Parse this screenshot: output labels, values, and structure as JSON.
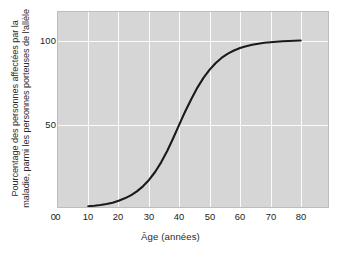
{
  "chart_data": {
    "type": "line",
    "title": "",
    "xlabel": "Âge (années)",
    "ylabel_lines": [
      "Pourcentage des personnes affectées par la",
      "maladie, parmi les personnes porteuses de l'allèle"
    ],
    "ylabel": "Pourcentage des personnes affectées par la maladie, parmi les personnes porteuses de l'allèle",
    "xlim": [
      0,
      89
    ],
    "ylim": [
      0,
      117
    ],
    "xticks": [
      0,
      10,
      20,
      30,
      40,
      50,
      60,
      70,
      80
    ],
    "xticklabels": [
      "0",
      "10",
      "20",
      "30",
      "40",
      "50",
      "60",
      "70",
      "80"
    ],
    "yticks": [
      0,
      50,
      100
    ],
    "yticklabels": [
      "0",
      "50",
      "100"
    ],
    "grid": true,
    "grid_color": "#fbfbfb",
    "plot_bgcolor": "#d6d6d6",
    "legend": "none",
    "series": [
      {
        "name": "Pénétrance liée à l'âge",
        "color": "#1a1a1a",
        "linewidth": 2.1,
        "x": [
          10,
          12,
          14,
          16,
          18,
          20,
          22,
          24,
          26,
          28,
          30,
          32,
          34,
          36,
          38,
          40,
          41,
          42,
          44,
          46,
          48,
          50,
          52,
          54,
          56,
          58,
          60,
          62,
          64,
          66,
          68,
          70,
          72,
          74,
          76,
          78,
          80
        ],
        "values": [
          0.5,
          0.8,
          1.2,
          1.8,
          2.6,
          3.8,
          5.2,
          7.0,
          9.4,
          12.4,
          16.2,
          21.0,
          26.8,
          33.6,
          41.4,
          49.6,
          53.6,
          57.6,
          65.0,
          71.8,
          77.6,
          82.4,
          86.4,
          89.6,
          92.0,
          93.9,
          95.4,
          96.5,
          97.3,
          98.0,
          98.5,
          98.9,
          99.2,
          99.4,
          99.6,
          99.8,
          99.9
        ]
      }
    ],
    "annotations": []
  }
}
